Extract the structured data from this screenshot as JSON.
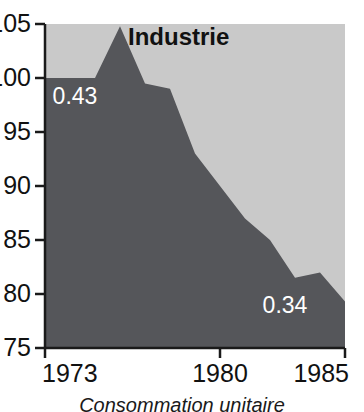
{
  "chart_data": {
    "type": "area",
    "title": "Industrie",
    "caption": "Consommation unitaire",
    "xlabel": "",
    "ylabel": "",
    "x": [
      1973,
      1974,
      1975,
      1976,
      1977,
      1978,
      1979,
      1980,
      1981,
      1982,
      1983,
      1984,
      1985
    ],
    "values": [
      100,
      100,
      100,
      104.8,
      99.5,
      99,
      93,
      90,
      87,
      85,
      81.5,
      82,
      79.3
    ],
    "series": [
      {
        "name": "Industrie",
        "values": [
          100,
          100,
          100,
          104.8,
          99.5,
          99,
          93,
          90,
          87,
          85,
          81.5,
          82,
          79.3
        ]
      }
    ],
    "xlim": [
      1973,
      1985
    ],
    "ylim": [
      75,
      105
    ],
    "y_ticks": [
      105,
      100,
      95,
      90,
      85,
      80,
      75
    ],
    "y_tick_labels": [
      "105",
      "100",
      "95",
      "90",
      "85",
      "80",
      "75"
    ],
    "x_ticks": [
      1973,
      1980,
      1985
    ],
    "x_tick_labels": [
      "1973",
      "1980",
      "1985"
    ],
    "grid": false,
    "legend": "none",
    "annotations": [
      {
        "text": "0.43",
        "x": 1974.2,
        "y": 97.6
      },
      {
        "text": "0.34",
        "x": 1982.6,
        "y": 78.2
      }
    ],
    "colors": {
      "area_fill": "#55565a",
      "plot_background": "#c9c9c9",
      "axis": "#1a1a1a",
      "label_text": "#111111",
      "annotation_text": "#ffffff"
    }
  }
}
